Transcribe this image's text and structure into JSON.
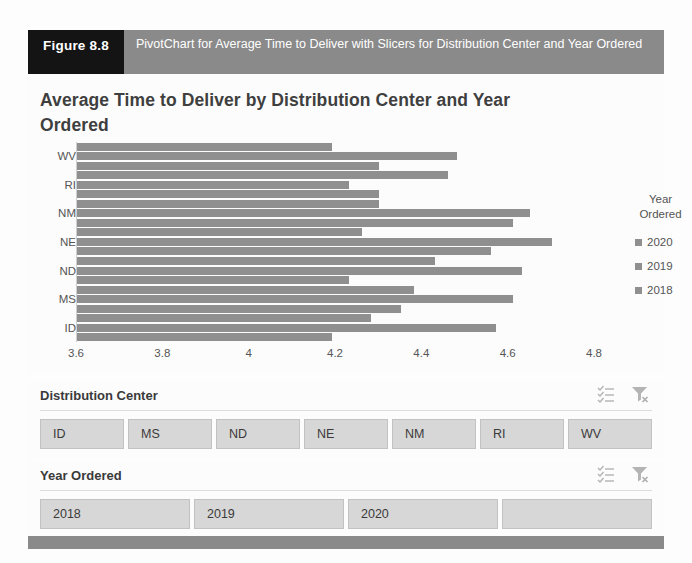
{
  "figure": {
    "tag": "Figure 8.8",
    "caption": "PivotChart for Average Time to Deliver with Slicers for Distribution Center and Year Ordered"
  },
  "chart": {
    "title": "Average Time to Deliver by Distribution Center and Year Ordered"
  },
  "legend": {
    "title_line1": "Year",
    "title_line2": "Ordered",
    "items": [
      {
        "label": "2020"
      },
      {
        "label": "2019"
      },
      {
        "label": "2018"
      }
    ]
  },
  "slicers": [
    {
      "title": "Distribution Center",
      "multiselect_icon": "multi-select-icon",
      "clear_icon": "clear-filter-icon",
      "items": [
        "ID",
        "MS",
        "ND",
        "NE",
        "NM",
        "RI",
        "WV"
      ]
    },
    {
      "title": "Year Ordered",
      "multiselect_icon": "multi-select-icon",
      "clear_icon": "clear-filter-icon",
      "items": [
        "2018",
        "2019",
        "2020"
      ]
    }
  ],
  "chart_data": {
    "type": "bar",
    "orientation": "horizontal",
    "title": "Average Time to Deliver by Distribution Center and Year Ordered",
    "xlabel": "",
    "ylabel": "",
    "categories": [
      "WV",
      "RI",
      "NM",
      "NE",
      "ND",
      "MS",
      "ID"
    ],
    "series": [
      {
        "name": "2020",
        "values": [
          4.19,
          4.46,
          4.3,
          4.26,
          4.43,
          4.38,
          4.28
        ]
      },
      {
        "name": "2019",
        "values": [
          4.48,
          4.23,
          4.65,
          4.7,
          4.63,
          4.61,
          4.57
        ]
      },
      {
        "name": "2018",
        "values": [
          4.3,
          4.3,
          4.61,
          4.56,
          4.23,
          4.35,
          4.19
        ]
      }
    ],
    "xticks": [
      "3.6",
      "3.8",
      "4",
      "4.2",
      "4.4",
      "4.6",
      "4.8"
    ],
    "xlim": [
      3.6,
      4.8
    ],
    "grid": false,
    "legend_position": "right",
    "legend_title": "Year Ordered",
    "bar_color": "#8f8f8f"
  },
  "colors": {
    "caption_bar": "#8a8a8a",
    "caption_tag": "#141414",
    "bar": "#8f8f8f",
    "slicer_button": "#d7d7d7"
  }
}
